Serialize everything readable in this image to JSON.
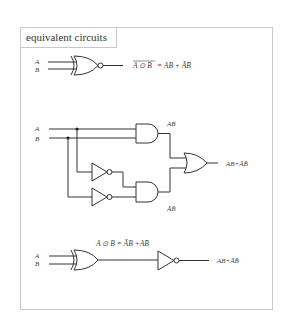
{
  "title": "equivalent circuits",
  "inputs": {
    "a": "A",
    "b": "B"
  },
  "circuit_1": {
    "gate": "XNOR",
    "equation_lhs": "A ⊙ B",
    "equation_rhs": "= AB + ĀB̄"
  },
  "circuit_2": {
    "gates": [
      "AND",
      "NOT",
      "NOT",
      "AND",
      "OR"
    ],
    "and_top_label": "AB",
    "and_bottom_label": "ĀB̄",
    "output_label": "AB+ĀB̄"
  },
  "circuit_3": {
    "gates": [
      "XOR",
      "NOT"
    ],
    "xor_label": "A ⊙ B = ĀB +AB̄",
    "output_label": "AB+ĀB̄"
  }
}
